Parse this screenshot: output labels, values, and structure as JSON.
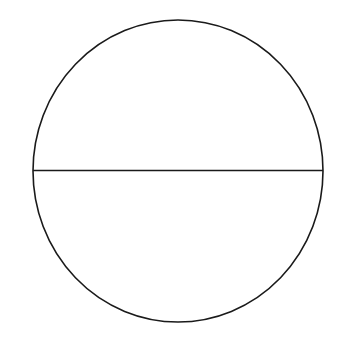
{
  "diagram": {
    "background": "#ffffff",
    "stroke_color": "#1a1a1a",
    "stroke_width": 1.6,
    "circle": {
      "cx": 178,
      "cy": 171,
      "rx": 145,
      "ry": 151
    },
    "diameter": {
      "x1": 33,
      "y1": 170.5,
      "x2": 323,
      "y2": 170.5
    }
  }
}
